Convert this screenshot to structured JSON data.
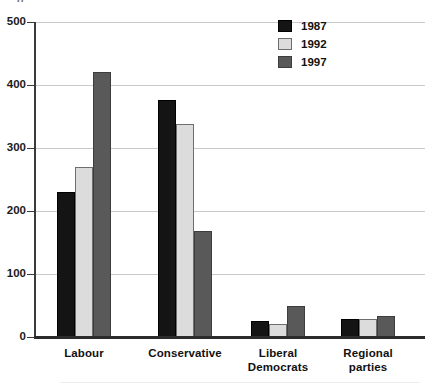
{
  "chart_data": {
    "type": "bar",
    "title": "",
    "xlabel": "",
    "ylabel": "",
    "ylim": [
      0,
      500
    ],
    "ytick_values": [
      500,
      400,
      300,
      200,
      100,
      0
    ],
    "ytick_labels": [
      "500",
      "400",
      "300",
      "200",
      "100",
      "0"
    ],
    "grid": true,
    "grid_axis": "y",
    "legend_position": "top-right",
    "categories": [
      "Labour",
      "Conservative",
      "Liberal Democrats",
      "Regional parties"
    ],
    "series": [
      {
        "name": "1987",
        "color": "#141414",
        "values": [
          230,
          377,
          25,
          28
        ]
      },
      {
        "name": "1992",
        "color": "#dcdcdc",
        "values": [
          270,
          338,
          20,
          28
        ]
      },
      {
        "name": "1997",
        "color": "#595959",
        "values": [
          420,
          168,
          50,
          33
        ]
      }
    ]
  },
  "axis": {
    "y_ticks": [
      {
        "label": "500",
        "value": 500
      },
      {
        "label": "400",
        "value": 400
      },
      {
        "label": "300",
        "value": 300
      },
      {
        "label": "200",
        "value": 200
      },
      {
        "label": "100",
        "value": 100
      },
      {
        "label": "0",
        "value": 0
      }
    ]
  },
  "legend": {
    "entries": [
      {
        "label": "1987",
        "series_class": "s1987"
      },
      {
        "label": "1992",
        "series_class": "s1992"
      },
      {
        "label": "1997",
        "series_class": "s1997"
      }
    ]
  },
  "x_categories": [
    {
      "line1": "Labour",
      "line2": ""
    },
    {
      "line1": "Conservative",
      "line2": ""
    },
    {
      "line1": "Liberal",
      "line2": "Democrats"
    },
    {
      "line1": "Regional",
      "line2": "parties"
    }
  ],
  "artifact": {
    "clipped_text": "g"
  }
}
